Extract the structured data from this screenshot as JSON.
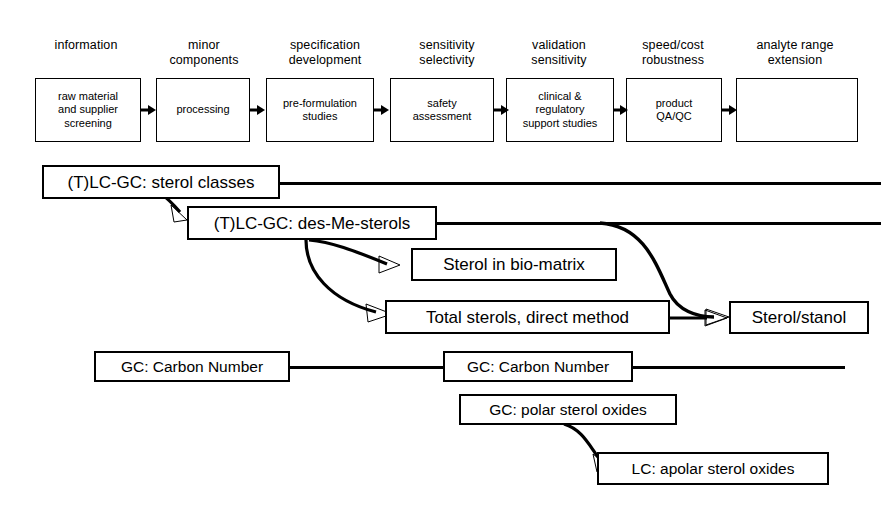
{
  "diagram": {
    "stroke_color": "#000000",
    "background_color": "#ffffff",
    "pipeline": {
      "headers": [
        "information",
        "minor\ncomponents",
        "specification\ndevelopment",
        "sensitivity\nselectivity",
        "validation\nsensitivity",
        "speed/cost\nrobustness",
        "analyte range\nextension"
      ],
      "boxes": [
        "raw  material\nand supplier\nscreening",
        "processing",
        "pre-formulation\nstudies",
        "safety\nassessment",
        "clinical &\nregulatory\nsupport studies",
        "product\nQA/QC",
        ""
      ],
      "connector_icon": "right-arrow-icon",
      "connector_count": 6
    },
    "methods": [
      {
        "id": "sterol-classes",
        "label": "(T)LC-GC: sterol classes"
      },
      {
        "id": "des-me-sterols",
        "label": "(T)LC-GC: des-Me-sterols"
      },
      {
        "id": "sterol-bio-matrix",
        "label": "Sterol in bio-matrix"
      },
      {
        "id": "total-sterols",
        "label": "Total sterols, direct method"
      },
      {
        "id": "sterol-stanol",
        "label": "Sterol/stanol"
      },
      {
        "id": "gc-carbon-number-1",
        "label": "GC: Carbon Number"
      },
      {
        "id": "gc-carbon-number-2",
        "label": "GC: Carbon Number"
      },
      {
        "id": "gc-polar-sterol-oxides",
        "label": "GC: polar sterol oxides"
      },
      {
        "id": "lc-apolar-sterol-oxides",
        "label": "LC: apolar sterol oxides"
      }
    ],
    "connections": [
      {
        "from": "sterol-classes",
        "to": "des-me-sterols",
        "kind": "curved-arrow"
      },
      {
        "from": "des-me-sterols",
        "to": "sterol-bio-matrix",
        "kind": "curved-arrow"
      },
      {
        "from": "des-me-sterols",
        "to": "total-sterols",
        "kind": "curved-arrow"
      },
      {
        "from": "des-me-sterols",
        "to": "sterol-stanol",
        "kind": "curved-arrow"
      },
      {
        "from": "total-sterols",
        "to": "sterol-stanol",
        "kind": "straight-arrow"
      },
      {
        "from": "gc-polar-sterol-oxides",
        "to": "lc-apolar-sterol-oxides",
        "kind": "curved-arrow"
      },
      {
        "from": "sterol-classes",
        "to": "right-edge",
        "kind": "line"
      },
      {
        "from": "des-me-sterols",
        "to": "right-edge",
        "kind": "line"
      },
      {
        "from": "gc-carbon-number-1",
        "to": "gc-carbon-number-2",
        "kind": "line"
      },
      {
        "from": "gc-carbon-number-2",
        "to": "right-edge",
        "kind": "line"
      }
    ]
  }
}
